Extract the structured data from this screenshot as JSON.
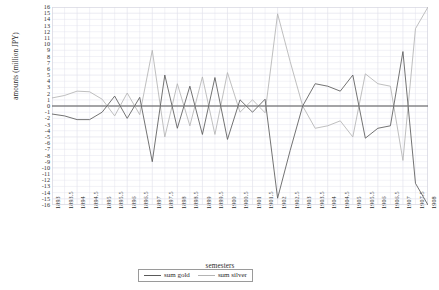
{
  "chart_data": {
    "type": "line",
    "title": "",
    "xlabel": "semesters",
    "ylabel": "amounts (million JPY)",
    "ylim": [
      -16,
      16
    ],
    "ytick_step": 1,
    "grid": true,
    "legend_position": "bottom",
    "yticks": [
      16,
      15,
      14,
      13,
      12,
      11,
      10,
      9,
      8,
      7,
      6,
      5,
      4,
      3,
      2,
      1,
      0,
      -1,
      -2,
      -3,
      -4,
      -5,
      -6,
      -7,
      -8,
      -9,
      -10,
      -11,
      -12,
      -13,
      -14,
      -15,
      -16
    ],
    "categories": [
      "1893",
      "1893.5",
      "1894",
      "1894.5",
      "1895",
      "1895.5",
      "1896",
      "1896.5",
      "1897",
      "1897.5",
      "1898",
      "1898.5",
      "1899",
      "1899.5",
      "1900",
      "1900.5",
      "1901",
      "1901.5",
      "1902",
      "1902.5",
      "1903",
      "1903.5",
      "1904",
      "1904.5",
      "1905",
      "1905.5",
      "1906",
      "1906.5",
      "1907",
      "1907.5",
      "1908"
    ],
    "series": [
      {
        "name": "sum gold",
        "color": "#5a5a5a",
        "values": [
          -1.3,
          -1.6,
          -2.2,
          -2.2,
          -1.0,
          1.6,
          -2.0,
          1.4,
          -9.0,
          5.0,
          -3.6,
          3.2,
          -4.6,
          4.6,
          -5.4,
          1.0,
          -1.0,
          1.1,
          -14.9,
          -7.2,
          0.0,
          3.6,
          3.2,
          2.4,
          5.0,
          -5.2,
          -3.6,
          -3.2,
          8.8,
          -12.5,
          -16.0
        ]
      },
      {
        "name": "sum silver",
        "color": "#b4b4b4",
        "values": [
          1.3,
          1.7,
          2.4,
          2.3,
          1.1,
          -1.6,
          2.1,
          -1.4,
          9.0,
          -5.0,
          3.6,
          -3.2,
          4.7,
          -4.6,
          5.4,
          -1.0,
          1.0,
          -1.1,
          14.9,
          7.2,
          0.0,
          -3.6,
          -3.2,
          -2.4,
          -5.0,
          5.2,
          3.6,
          3.2,
          -8.8,
          12.5,
          16.0
        ]
      }
    ]
  },
  "legend": {
    "items": [
      {
        "label": "sum gold"
      },
      {
        "label": "sum silver"
      }
    ]
  },
  "caption": {
    "text": ""
  },
  "colors": {
    "gold": "#5a5a5a",
    "silver": "#b4b4b4",
    "grid": "#e2e2ec",
    "axis": "#555555",
    "frame": "#d8d8e2"
  }
}
